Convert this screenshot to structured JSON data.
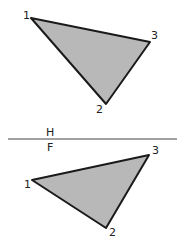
{
  "diagram": {
    "fold_line": {
      "top_label": "H",
      "bottom_label": "F"
    },
    "top_view": {
      "vertices": [
        {
          "label": "1",
          "x": 31,
          "y": 18
        },
        {
          "label": "2",
          "x": 106,
          "y": 104
        },
        {
          "label": "3",
          "x": 150,
          "y": 42
        }
      ]
    },
    "front_view": {
      "vertices": [
        {
          "label": "1",
          "x": 32,
          "y": 180
        },
        {
          "label": "2",
          "x": 106,
          "y": 228
        },
        {
          "label": "3",
          "x": 149,
          "y": 155
        }
      ]
    },
    "fill_color": "#b8b8b8",
    "stroke_color": "#1a1a1a"
  }
}
